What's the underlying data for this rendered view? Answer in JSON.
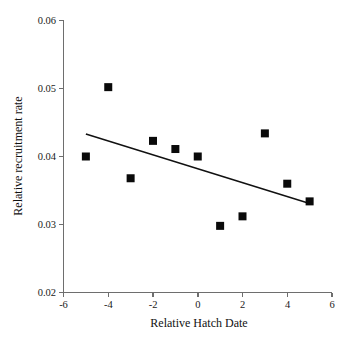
{
  "chart_data": {
    "type": "scatter",
    "title": "",
    "xlabel": "Relative Hatch Date",
    "ylabel": "Relative recruitment rate",
    "x": [
      -5,
      -4,
      -3,
      -2,
      -1,
      0,
      1,
      2,
      3,
      4,
      5
    ],
    "values": [
      0.04,
      0.0502,
      0.0368,
      0.0423,
      0.0411,
      0.04,
      0.0298,
      0.0312,
      0.0434,
      0.036,
      0.0334
    ],
    "series": [
      {
        "name": "Relative recruitment rate",
        "marker": "filled-square",
        "color": "#0a0a0a",
        "points": [
          {
            "x": -5,
            "y": 0.04
          },
          {
            "x": -4,
            "y": 0.0502
          },
          {
            "x": -3,
            "y": 0.0368
          },
          {
            "x": -2,
            "y": 0.0423
          },
          {
            "x": -1,
            "y": 0.0411
          },
          {
            "x": 0,
            "y": 0.04
          },
          {
            "x": 1,
            "y": 0.0298
          },
          {
            "x": 2,
            "y": 0.0312
          },
          {
            "x": 3,
            "y": 0.0434
          },
          {
            "x": 4,
            "y": 0.036
          },
          {
            "x": 5,
            "y": 0.0334
          }
        ]
      }
    ],
    "trendline": {
      "type": "linear-fit",
      "color": "#111111",
      "x_start": -5,
      "y_start": 0.0433,
      "x_end": 5,
      "y_end": 0.0331
    },
    "xlim": [
      -6,
      6
    ],
    "ylim": [
      0.02,
      0.06
    ],
    "xticks": [
      -6,
      -4,
      -2,
      0,
      2,
      4,
      6
    ],
    "yticks": [
      0.02,
      0.03,
      0.04,
      0.05,
      0.06
    ],
    "xtick_labels": [
      "-6",
      "-4",
      "-2",
      "0",
      "2",
      "4",
      "6"
    ],
    "ytick_labels": [
      "0.02",
      "0.03",
      "0.04",
      "0.05",
      "0.06"
    ],
    "grid": false,
    "legend": "none"
  },
  "figure": {
    "caption_fragment": ""
  }
}
